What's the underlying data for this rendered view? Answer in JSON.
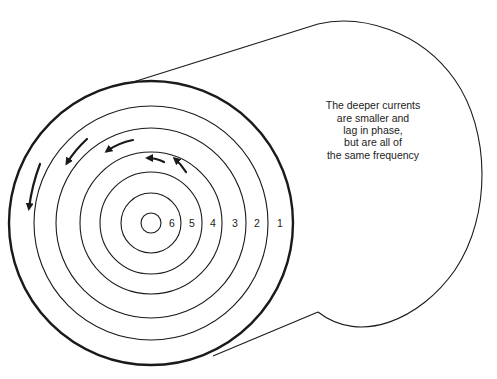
{
  "figure": {
    "type": "skin-effect cross-section diagram",
    "caption_lines": [
      "The deeper currents",
      "are smaller and",
      "lag in phase,",
      "but are all of",
      "the same frequency"
    ],
    "ring_labels": [
      "6",
      "5",
      "4",
      "3",
      "2",
      "1"
    ],
    "colors": {
      "stroke": "#1a1a1a",
      "text": "#222222",
      "background": "#ffffff"
    },
    "geometry": {
      "center": [
        151,
        223
      ],
      "radii": [
        10,
        30,
        51,
        71,
        95,
        117,
        142
      ],
      "label_x": [
        172,
        192,
        213,
        235,
        257,
        280
      ],
      "back_ellipse_right_x": 483
    },
    "arrows": [
      {
        "name": "arrow-ring-6",
        "from": [
          186,
          172
        ],
        "to": [
          174,
          158
        ]
      },
      {
        "name": "arrow-ring-5",
        "from": [
          164,
          162
        ],
        "to": [
          146,
          158
        ]
      },
      {
        "name": "arrow-ring-4",
        "from": [
          133,
          140
        ],
        "to": [
          105,
          152
        ]
      },
      {
        "name": "arrow-ring-3",
        "from": [
          87,
          139
        ],
        "to": [
          66,
          165
        ]
      },
      {
        "name": "arrow-ring-2",
        "from": [
          40,
          164
        ],
        "to": [
          28,
          210
        ]
      }
    ]
  }
}
